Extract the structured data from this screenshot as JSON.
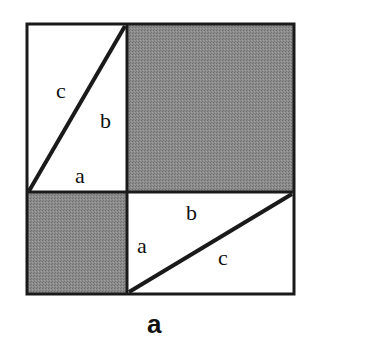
{
  "figure": {
    "caption": "a",
    "colors": {
      "shade": "#8a8a8a",
      "stroke": "#1a1a1a",
      "background": "#ffffff"
    },
    "top_left_triangle_labels": {
      "hyp": "c",
      "leg_vertical": "b",
      "leg_horizontal": "a"
    },
    "bottom_right_triangle_labels": {
      "hyp": "c",
      "leg_horizontal": "b",
      "leg_vertical": "a"
    },
    "regions": [
      {
        "name": "large-shaded-square",
        "side": "b"
      },
      {
        "name": "small-shaded-square",
        "side": "a"
      },
      {
        "name": "rectangle-top-left",
        "split_by": "diagonal c"
      },
      {
        "name": "rectangle-bottom-right",
        "split_by": "diagonal c"
      }
    ]
  }
}
